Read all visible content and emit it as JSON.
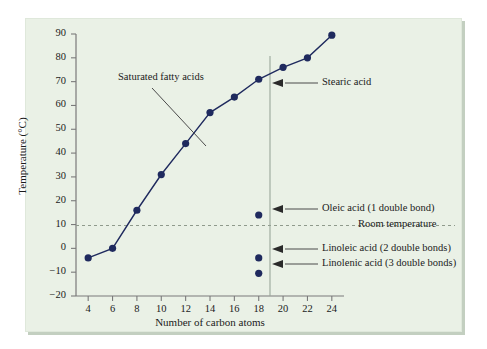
{
  "figure": {
    "background_color": "#eaf1e6",
    "data_color": "#1f2a5e",
    "axis_color": "#7a7a7a"
  },
  "chart_data": {
    "type": "line",
    "title": "",
    "xlabel": "Number of carbon atoms",
    "ylabel": "Temperature (°C)",
    "xlim": [
      3,
      25
    ],
    "ylim": [
      -20,
      90
    ],
    "xticks": [
      4,
      6,
      8,
      10,
      12,
      14,
      16,
      18,
      20,
      22,
      24
    ],
    "xtick_labels": [
      "4",
      "6",
      "8",
      "10",
      "12",
      "14",
      "16",
      "18",
      "20",
      "22",
      "24"
    ],
    "yticks": [
      -20,
      -10,
      0,
      10,
      20,
      30,
      40,
      50,
      60,
      70,
      80,
      90
    ],
    "ytick_labels": [
      "−20",
      "−10",
      "0",
      "10",
      "20",
      "30",
      "40",
      "50",
      "60",
      "70",
      "80",
      "90"
    ],
    "grid": false,
    "legend": "none",
    "series": [
      {
        "name": "Saturated fatty acids",
        "marker": "circle",
        "x": [
          4,
          6,
          8,
          10,
          12,
          14,
          16,
          18,
          20,
          22,
          24
        ],
        "values": [
          -4,
          0,
          16,
          31,
          44,
          57,
          63.5,
          71,
          76,
          80,
          89.5
        ]
      },
      {
        "name": "Unsaturated fatty acids (C18)",
        "marker": "circle",
        "connected": false,
        "x": [
          18,
          18,
          18
        ],
        "values": [
          14,
          -4,
          -10.5
        ],
        "point_labels": [
          "Oleic acid (1 double bond)",
          "Linoleic acid (2 double bonds)",
          "Linolenic acid (3 double bonds)"
        ]
      }
    ],
    "reference_lines": [
      {
        "name": "room-temperature",
        "orientation": "horizontal",
        "value": 25,
        "style": "dashed",
        "label": "Room temperature"
      },
      {
        "name": "c18-marker",
        "orientation": "vertical",
        "value": 18,
        "style": "solid",
        "label": ""
      }
    ],
    "annotations": [
      {
        "name": "saturated-fatty-acids",
        "text": "Saturated fatty acids",
        "points_to_x": 12.9,
        "points_to_y": 50
      },
      {
        "name": "stearic-acid",
        "text": "Stearic acid",
        "points_to_x": 18,
        "points_to_y": 71
      },
      {
        "name": "oleic-acid",
        "text": "Oleic acid (1 double bond)",
        "points_to_x": 18,
        "points_to_y": 14
      },
      {
        "name": "linoleic-acid",
        "text": "Linoleic acid (2 double bonds)",
        "points_to_x": 18,
        "points_to_y": -4
      },
      {
        "name": "linolenic-acid",
        "text": "Linolenic acid (3 double bonds)",
        "points_to_x": 18,
        "points_to_y": -10.5
      },
      {
        "name": "room-temperature",
        "text": "Room temperature",
        "points_to_x": 24,
        "points_to_y": 25
      }
    ]
  }
}
